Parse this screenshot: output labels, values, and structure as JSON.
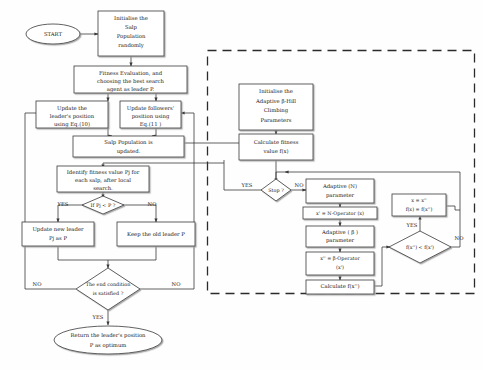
{
  "diagram": {
    "colors": {
      "stroke": "#3a3a3a",
      "text": "#1a1a1a",
      "background": "#fefefe",
      "dashed_region": "#2b2b2b"
    }
  },
  "nodes": {
    "start": {
      "label": "START",
      "shape": "oval"
    },
    "init_salp": {
      "line1": "Initialise the",
      "line2": "Salp",
      "line3": "Population",
      "line4": "randomly",
      "shape": "rect"
    },
    "fitness_eval": {
      "line1": "Fitness Evaluation, and",
      "line2": "choosing the best search",
      "line3": "agent as leader P.",
      "shape": "rect"
    },
    "update_leader": {
      "line1": "Update the",
      "line2": "leader's position",
      "line3": "using Eq.(10)",
      "shape": "rect"
    },
    "update_followers": {
      "line1": "Update followers'",
      "line2": "position using",
      "line3": "Eq.(11 )",
      "shape": "rect"
    },
    "salp_updated": {
      "line1": "Salp Population  is",
      "line2": "updated.",
      "shape": "rect"
    },
    "identify_fitness": {
      "line1": "Identify fitness value Pj for",
      "line2": "each salp, after local",
      "line3": "search.",
      "shape": "rect"
    },
    "if_pj": {
      "label": "If Pj < P ?",
      "shape": "diamond"
    },
    "update_new_leader": {
      "line1": "Update new leader",
      "line2": "Pj as P",
      "shape": "rect"
    },
    "keep_old_leader": {
      "line1": "Keep the old leader P",
      "shape": "rect"
    },
    "end_condition": {
      "line1": "The end condition",
      "line2": "is satisfied ?",
      "shape": "diamond"
    },
    "return_leader": {
      "line1": "Return the leader's  position",
      "line2": "P as optimum",
      "shape": "oval"
    },
    "init_bhc": {
      "line1": "Initialise the",
      "line2": "Adaptive β-Hill",
      "line3": "Climbing",
      "line4": "Parameters",
      "shape": "rect"
    },
    "calc_fx": {
      "line1": "Calculate fitness",
      "line2": "value  f(x)",
      "shape": "rect"
    },
    "stop": {
      "label": "Stop ?",
      "shape": "diamond"
    },
    "adaptive_n": {
      "line1": "Adaptive (N)",
      "line2": "parameter",
      "shape": "rect"
    },
    "n_operator": {
      "line1": "x' = N-Operator (x)",
      "shape": "rect"
    },
    "adaptive_beta": {
      "line1": "Adaptive ( β )",
      "line2": "parameter",
      "shape": "rect"
    },
    "beta_operator": {
      "line1": "x'' = β-Operator",
      "line2": "(x')",
      "shape": "rect"
    },
    "calc_fx2": {
      "line1": "Calculate f(x'')",
      "shape": "rect"
    },
    "compare": {
      "label": "f(x'') < f(x')",
      "shape": "diamond"
    },
    "assign": {
      "line1": "x = x''",
      "line2": "f(x) = f(x'')",
      "shape": "rect"
    }
  },
  "edge_labels": {
    "if_pj_yes": "YES",
    "if_pj_no": "NO",
    "end_no_left": "NO",
    "end_no_right": "NO",
    "end_yes": "YES",
    "stop_yes": "YES",
    "stop_no": "NO",
    "compare_yes": "YES",
    "compare_no": "NO"
  }
}
